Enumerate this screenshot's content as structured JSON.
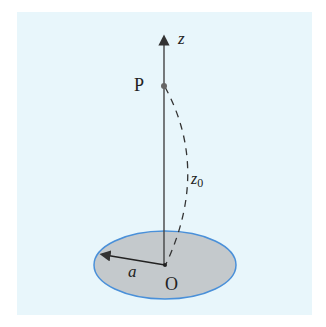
{
  "diagram": {
    "labels": {
      "axis": "z",
      "point": "P",
      "distance": "z",
      "distance_sub": "0",
      "radius": "a",
      "origin": "O"
    },
    "colors": {
      "panel_bg": "#e8f6fb",
      "disc_fill": "#c4c9cc",
      "disc_edge": "#4a90d9",
      "line": "#333333",
      "point": "#666666"
    }
  }
}
